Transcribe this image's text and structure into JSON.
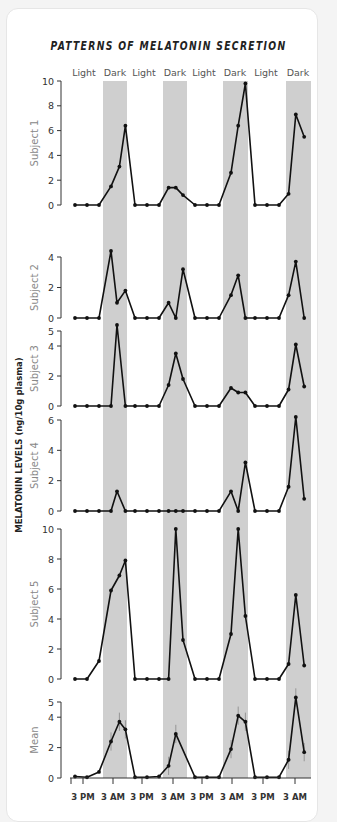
{
  "chart_data": {
    "type": "line",
    "title": "PATTERNS OF MELATONIN SECRETION",
    "ylabel": "MELATONIN LEVELS (ng/10g plasma)",
    "xlabel": "",
    "phases": [
      "Light",
      "Dark",
      "Light",
      "Dark",
      "Light",
      "Dark",
      "Light",
      "Dark"
    ],
    "x_tick_labels": [
      "3 PM",
      "3 AM",
      "3 PM",
      "3 AM",
      "3 PM",
      "3 AM",
      "3 PM",
      "3 AM"
    ],
    "grid": false,
    "legend": "none",
    "panels": [
      {
        "name": "Subject 1",
        "ylim": [
          0,
          10
        ],
        "yticks": [
          0,
          2,
          4,
          6,
          8,
          10
        ],
        "points": [
          [
            0,
            0
          ],
          [
            1,
            0
          ],
          [
            2,
            0
          ],
          [
            3,
            1.5
          ],
          [
            3.7,
            3.1
          ],
          [
            4.2,
            6.4
          ],
          [
            5,
            0
          ],
          [
            6,
            0
          ],
          [
            7,
            0
          ],
          [
            7.8,
            1.4
          ],
          [
            8.4,
            1.4
          ],
          [
            9,
            0.8
          ],
          [
            10,
            0
          ],
          [
            11,
            0
          ],
          [
            12,
            0
          ],
          [
            13,
            2.6
          ],
          [
            13.6,
            6.4
          ],
          [
            14.2,
            9.8
          ],
          [
            15,
            0
          ],
          [
            16,
            0
          ],
          [
            17,
            0
          ],
          [
            17.8,
            0.9
          ],
          [
            18.4,
            7.3
          ],
          [
            19.1,
            5.5
          ]
        ]
      },
      {
        "name": "Subject 2",
        "ylim": [
          0,
          4
        ],
        "yticks": [
          0,
          2,
          4
        ],
        "points": [
          [
            0,
            0
          ],
          [
            1,
            0
          ],
          [
            2,
            0
          ],
          [
            3,
            4.4
          ],
          [
            3.5,
            1
          ],
          [
            4.2,
            1.8
          ],
          [
            5,
            0
          ],
          [
            6,
            0
          ],
          [
            7,
            0
          ],
          [
            7.8,
            1
          ],
          [
            8.4,
            0
          ],
          [
            9,
            3.2
          ],
          [
            10,
            0
          ],
          [
            11,
            0
          ],
          [
            12,
            0
          ],
          [
            13,
            1.5
          ],
          [
            13.6,
            2.8
          ],
          [
            14.2,
            0
          ],
          [
            15,
            0
          ],
          [
            16,
            0
          ],
          [
            17,
            0
          ],
          [
            17.8,
            1.5
          ],
          [
            18.4,
            3.7
          ],
          [
            19.1,
            0
          ]
        ]
      },
      {
        "name": "Subject 3",
        "ylim": [
          0,
          5
        ],
        "yticks": [
          0,
          2,
          4,
          5
        ],
        "points": [
          [
            0,
            0
          ],
          [
            1,
            0
          ],
          [
            2,
            0
          ],
          [
            3,
            0
          ],
          [
            3.5,
            5.4
          ],
          [
            4.2,
            0
          ],
          [
            5,
            0
          ],
          [
            6,
            0
          ],
          [
            7,
            0
          ],
          [
            7.8,
            1.4
          ],
          [
            8.4,
            3.5
          ],
          [
            9,
            1.8
          ],
          [
            10,
            0
          ],
          [
            11,
            0
          ],
          [
            12,
            0
          ],
          [
            13,
            1.2
          ],
          [
            13.6,
            0.9
          ],
          [
            14.2,
            0.9
          ],
          [
            15,
            0
          ],
          [
            16,
            0
          ],
          [
            17,
            0
          ],
          [
            17.8,
            1.1
          ],
          [
            18.4,
            4.1
          ],
          [
            19.1,
            1.3
          ]
        ]
      },
      {
        "name": "Subject 4",
        "ylim": [
          0,
          6
        ],
        "yticks": [
          0,
          2,
          4,
          6
        ],
        "points": [
          [
            0,
            0
          ],
          [
            1,
            0
          ],
          [
            2,
            0
          ],
          [
            3,
            0
          ],
          [
            3.5,
            1.3
          ],
          [
            4.2,
            0
          ],
          [
            5,
            0
          ],
          [
            6,
            0
          ],
          [
            7,
            0
          ],
          [
            7.8,
            0
          ],
          [
            8.4,
            0
          ],
          [
            9,
            0
          ],
          [
            10,
            0
          ],
          [
            11,
            0
          ],
          [
            12,
            0
          ],
          [
            13,
            1.3
          ],
          [
            13.6,
            0
          ],
          [
            14.2,
            3.2
          ],
          [
            15,
            0
          ],
          [
            16,
            0
          ],
          [
            17,
            0
          ],
          [
            17.8,
            1.6
          ],
          [
            18.4,
            6.2
          ],
          [
            19.1,
            0.8
          ]
        ]
      },
      {
        "name": "Subject 5",
        "ylim": [
          0,
          10
        ],
        "yticks": [
          0,
          2,
          4,
          6,
          8,
          10
        ],
        "points": [
          [
            0,
            0
          ],
          [
            1,
            0
          ],
          [
            2,
            1.2
          ],
          [
            3,
            5.9
          ],
          [
            3.7,
            6.9
          ],
          [
            4.2,
            7.9
          ],
          [
            5,
            0
          ],
          [
            6,
            0
          ],
          [
            7,
            0
          ],
          [
            7.8,
            0
          ],
          [
            8.4,
            10
          ],
          [
            9,
            2.6
          ],
          [
            10,
            0
          ],
          [
            11,
            0
          ],
          [
            12,
            0
          ],
          [
            13,
            3
          ],
          [
            13.6,
            10
          ],
          [
            14.2,
            4.2
          ],
          [
            15,
            0
          ],
          [
            16,
            0
          ],
          [
            17,
            0
          ],
          [
            17.8,
            1
          ],
          [
            18.4,
            5.6
          ],
          [
            19.1,
            0.9
          ]
        ]
      },
      {
        "name": "Mean",
        "ylim": [
          0,
          5
        ],
        "yticks": [
          0,
          2,
          4,
          5
        ],
        "points": [
          [
            0,
            0.1
          ],
          [
            1,
            0.05
          ],
          [
            2,
            0.4
          ],
          [
            3,
            2.4
          ],
          [
            3.7,
            3.7
          ],
          [
            4.2,
            3.2
          ],
          [
            5,
            0.05
          ],
          [
            6,
            0.05
          ],
          [
            7,
            0.1
          ],
          [
            7.8,
            0.8
          ],
          [
            8.4,
            2.9
          ],
          [
            10,
            0.05
          ],
          [
            11,
            0.05
          ],
          [
            12,
            0.05
          ],
          [
            13,
            1.9
          ],
          [
            13.6,
            4.1
          ],
          [
            14.2,
            3.7
          ],
          [
            15,
            0.05
          ],
          [
            16,
            0.05
          ],
          [
            17,
            0.05
          ],
          [
            17.8,
            1.2
          ],
          [
            18.4,
            5.3
          ],
          [
            19.1,
            1.7
          ]
        ],
        "error_bars": true
      }
    ]
  }
}
